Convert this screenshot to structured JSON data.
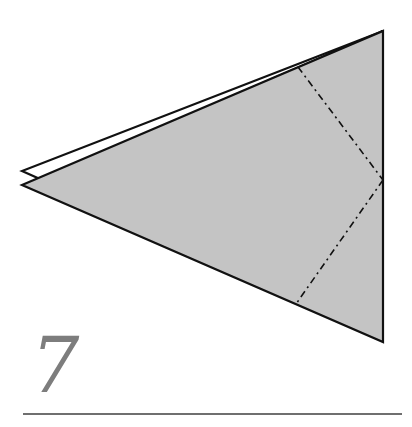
{
  "diagram": {
    "type": "origami-step",
    "step_number": "7",
    "colors": {
      "paper_fill": "#c4c4c4",
      "outline": "#111111",
      "step_number": "#7d7d7d",
      "rule": "#6f6f6f"
    },
    "shapes": {
      "back_layer": [
        [
          22,
          171
        ],
        [
          40,
          179
        ],
        [
          383,
          31
        ]
      ],
      "front_layer": [
        [
          22,
          185
        ],
        [
          383,
          31
        ],
        [
          383,
          342
        ]
      ],
      "mountain_fold_lines": [
        {
          "from": [
            298,
            67
          ],
          "to": [
            383,
            180
          ]
        },
        {
          "from": [
            383,
            180
          ],
          "to": [
            296,
            304
          ]
        }
      ]
    }
  }
}
